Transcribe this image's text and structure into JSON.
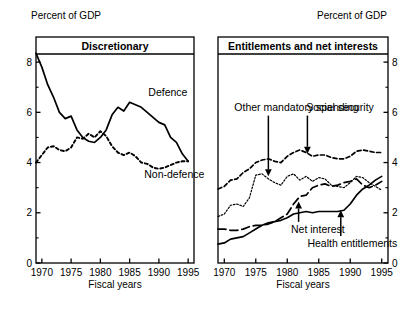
{
  "figure": {
    "axis_label_y_left": "Percent of GDP",
    "axis_label_y_right": "Percent of GDP",
    "xlabel_left": "Fiscal years",
    "xlabel_right": "Fiscal years"
  },
  "chart_data": [
    {
      "type": "line",
      "title": "Discretionary",
      "xlabel": "Fiscal years",
      "ylabel": "Percent of GDP",
      "xlim": [
        1969,
        1996
      ],
      "ylim": [
        0,
        9
      ],
      "xticks": [
        1970,
        1975,
        1980,
        1985,
        1990,
        1995
      ],
      "xtick_labels": [
        "1970",
        "1975",
        "1980",
        "1985",
        "1990",
        "1995"
      ],
      "yticks": [
        0,
        2,
        4,
        6,
        8
      ],
      "ytick_labels": [
        "0",
        "2",
        "4",
        "6",
        "8"
      ],
      "yminorticks": [
        1,
        3,
        5,
        7
      ],
      "grid": false,
      "yaxis_side": "left",
      "legend": "inline-annotations",
      "x": [
        1969,
        1970,
        1971,
        1972,
        1973,
        1974,
        1975,
        1976,
        1977,
        1978,
        1979,
        1980,
        1981,
        1982,
        1983,
        1984,
        1985,
        1986,
        1987,
        1988,
        1989,
        1990,
        1991,
        1992,
        1993,
        1994,
        1995
      ],
      "series": [
        {
          "name": "Defence",
          "style": "solid",
          "label_pos": {
            "x": 1988.2,
            "y": 6.65
          },
          "values": [
            8.35,
            7.8,
            7.1,
            6.6,
            6.0,
            5.75,
            5.85,
            5.3,
            5.0,
            4.85,
            4.8,
            5.0,
            5.3,
            5.9,
            6.2,
            6.05,
            6.4,
            6.3,
            6.2,
            6.0,
            5.8,
            5.6,
            5.5,
            5.0,
            4.8,
            4.35,
            4.05
          ]
        },
        {
          "name": "Non-defence",
          "style": "dotted",
          "label_pos": {
            "x": 1987.5,
            "y": 3.4
          },
          "values": [
            4.0,
            4.3,
            4.6,
            4.65,
            4.5,
            4.45,
            4.6,
            5.0,
            4.95,
            5.15,
            5.0,
            5.25,
            5.05,
            4.65,
            4.4,
            4.3,
            4.4,
            4.25,
            4.0,
            3.95,
            3.8,
            3.75,
            3.8,
            3.9,
            4.0,
            4.05,
            4.05
          ]
        }
      ]
    },
    {
      "type": "line",
      "title": "Entitlements and net interests",
      "xlabel": "Fiscal years",
      "ylabel": "Percent of GDP",
      "xlim": [
        1969,
        1996
      ],
      "ylim": [
        0,
        9
      ],
      "xticks": [
        1970,
        1975,
        1980,
        1985,
        1990,
        1995
      ],
      "xtick_labels": [
        "1970",
        "1975",
        "1980",
        "1985",
        "1990",
        "1995"
      ],
      "yticks": [
        0,
        2,
        4,
        6,
        8
      ],
      "ytick_labels": [
        "0",
        "2",
        "4",
        "6",
        "8"
      ],
      "yminorticks": [
        1,
        3,
        5,
        7
      ],
      "grid": false,
      "yaxis_side": "right",
      "legend": "arrow-annotations",
      "x": [
        1969,
        1970,
        1971,
        1972,
        1973,
        1974,
        1975,
        1976,
        1977,
        1978,
        1979,
        1980,
        1981,
        1982,
        1983,
        1984,
        1985,
        1986,
        1987,
        1988,
        1989,
        1990,
        1991,
        1992,
        1993,
        1994,
        1995
      ],
      "series": [
        {
          "name": "Social security",
          "style": "dashed-dotted",
          "annotation": {
            "label": "Social security",
            "label_xy": [
              1983.0,
              6.05
            ],
            "arrow_to": [
              1983.2,
              4.35
            ]
          },
          "values": [
            2.95,
            3.05,
            3.3,
            3.35,
            3.6,
            3.75,
            4.0,
            4.1,
            4.15,
            4.05,
            4.0,
            4.25,
            4.4,
            4.5,
            4.4,
            4.25,
            4.3,
            4.3,
            4.2,
            4.15,
            4.15,
            4.25,
            4.45,
            4.5,
            4.45,
            4.4,
            4.4
          ]
        },
        {
          "name": "Other mandatory spending",
          "style": "dotted-fine",
          "annotation": {
            "label": "Other mandatory spending",
            "label_xy": [
              1971.6,
              6.05
            ],
            "arrow_to": [
              1977.0,
              3.45
            ]
          },
          "values": [
            1.85,
            1.95,
            2.3,
            2.35,
            2.25,
            2.6,
            3.5,
            3.55,
            3.35,
            3.2,
            3.1,
            3.45,
            3.55,
            3.3,
            3.45,
            3.25,
            3.4,
            3.35,
            3.1,
            3.05,
            3.0,
            3.2,
            3.45,
            3.4,
            3.2,
            3.05,
            2.9
          ]
        },
        {
          "name": "Net interest",
          "style": "dashed",
          "annotation": {
            "label": "Net interest",
            "label_xy": [
              1980.6,
              1.18
            ],
            "arrow_to": [
              1981.8,
              2.45
            ]
          },
          "values": [
            1.35,
            1.35,
            1.3,
            1.3,
            1.35,
            1.45,
            1.5,
            1.5,
            1.55,
            1.65,
            1.8,
            1.95,
            2.35,
            2.65,
            2.7,
            3.0,
            3.1,
            3.15,
            3.05,
            3.1,
            3.2,
            3.25,
            3.35,
            3.1,
            3.0,
            3.1,
            3.25
          ]
        },
        {
          "name": "Health entitlements",
          "style": "solid",
          "annotation": {
            "label": "Health entitlements",
            "label_xy": [
              1983.2,
              0.62
            ],
            "arrow_to": [
              1988.5,
              2.1
            ]
          },
          "values": [
            0.75,
            0.8,
            0.95,
            1.0,
            1.05,
            1.2,
            1.35,
            1.5,
            1.6,
            1.65,
            1.7,
            1.8,
            1.95,
            2.0,
            2.05,
            2.0,
            2.05,
            2.05,
            2.05,
            2.05,
            2.1,
            2.35,
            2.7,
            2.95,
            3.1,
            3.3,
            3.45
          ]
        }
      ]
    }
  ]
}
